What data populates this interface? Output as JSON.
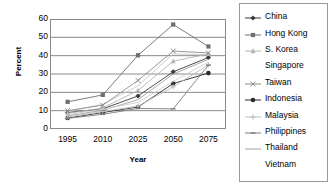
{
  "chart_data": {
    "type": "line",
    "title": "",
    "xlabel": "Year",
    "ylabel": "Percent",
    "x": [
      1995,
      2010,
      2025,
      2050,
      2075
    ],
    "categories": [
      "1995",
      "2010",
      "2025",
      "2050",
      "2075"
    ],
    "xticklabels": [
      "1995",
      "2010",
      "2025",
      "2050",
      "2075"
    ],
    "yticklabels": [
      "0",
      "10",
      "20",
      "30",
      "40",
      "50",
      "60"
    ],
    "yticks": [
      0,
      10,
      20,
      30,
      40,
      50,
      60
    ],
    "ylim": [
      0,
      60
    ],
    "grid": "horizontal",
    "legend_position": "right",
    "series": [
      {
        "name": "China",
        "marker": "diamond",
        "color": "#3a3a3a",
        "values": [
          9.0,
          11.0,
          18.0,
          31.2,
          39.0
        ]
      },
      {
        "name": "Hong Kong",
        "marker": "square",
        "color": "#6e6e6e",
        "values": [
          14.8,
          18.6,
          40.2,
          57.0,
          45.0
        ]
      },
      {
        "name": "S. Korea",
        "marker": "triangle",
        "color": "#b4b4b4",
        "values": [
          8.5,
          11.5,
          21.0,
          37.0,
          41.0
        ]
      },
      {
        "name": "Singapore",
        "marker": "none",
        "color": "#c8c8c8",
        "values": [
          9.5,
          13.5,
          23.5,
          41.0,
          40.5
        ]
      },
      {
        "name": "Taiwan",
        "marker": "cross",
        "color": "#8c8c8c",
        "values": [
          10.0,
          13.0,
          26.5,
          42.5,
          41.5
        ]
      },
      {
        "name": "Indonesia",
        "marker": "circle",
        "color": "#2b2b2b",
        "values": [
          6.0,
          9.0,
          12.0,
          24.8,
          30.5
        ]
      },
      {
        "name": "Malaysia",
        "marker": "plus",
        "color": "#bdbdbd",
        "values": [
          6.5,
          9.5,
          12.5,
          23.0,
          35.0
        ]
      },
      {
        "name": "Philippines",
        "marker": "dash",
        "color": "#7d7d7d",
        "values": [
          5.8,
          8.0,
          11.2,
          11.0,
          34.8
        ]
      },
      {
        "name": "Thailand",
        "marker": "line",
        "color": "#a0a0a0",
        "values": [
          7.2,
          10.2,
          16.0,
          30.0,
          38.0
        ]
      },
      {
        "name": "Vietnam",
        "marker": "none",
        "color": "#cfcfcf",
        "values": [
          7.8,
          10.8,
          14.5,
          26.0,
          36.5
        ]
      }
    ]
  },
  "legend": {
    "items": [
      {
        "label": "China"
      },
      {
        "label": "Hong Kong"
      },
      {
        "label": "S. Korea"
      },
      {
        "label": "Singapore"
      },
      {
        "label": "Taiwan"
      },
      {
        "label": "Indonesia"
      },
      {
        "label": "Malaysia"
      },
      {
        "label": "Philippines"
      },
      {
        "label": "Thailand"
      },
      {
        "label": "Vietnam"
      }
    ]
  }
}
